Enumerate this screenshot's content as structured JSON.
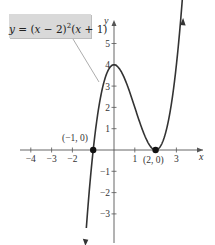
{
  "chart_data": {
    "type": "line",
    "title": "",
    "equation_label": "y = (x − 2)²(x + 1)",
    "function": "y = (x - 2)^2 (x + 1)",
    "xlabel": "x",
    "ylabel": "y",
    "xlim": [
      -4.5,
      3.8
    ],
    "ylim": [
      -4.5,
      5.8
    ],
    "x_ticks": [
      -4,
      -3,
      -2,
      -1,
      1,
      2,
      3
    ],
    "y_ticks": [
      -3,
      -2,
      -1,
      1,
      2,
      3,
      4,
      5
    ],
    "x_tick_labels": [
      "−4",
      "−3",
      "−2",
      "",
      "1",
      "",
      "3"
    ],
    "y_tick_labels": [
      "−3",
      "−2",
      "−1",
      "1",
      "2",
      "3",
      "4",
      "5"
    ],
    "grid": false,
    "series": [
      {
        "name": "y = (x − 2)²(x + 1)",
        "x": [
          -1.3,
          -1,
          -0.5,
          0,
          0.5,
          1,
          1.5,
          2,
          2.5,
          3,
          3.4
        ],
        "y": [
          -3.87,
          0,
          3.125,
          4,
          3.375,
          2,
          0.625,
          0,
          0.875,
          4,
          8.23
        ]
      }
    ],
    "points": [
      {
        "label": "(−1, 0)",
        "x": -1,
        "y": 0
      },
      {
        "label": "(2, 0)",
        "x": 2,
        "y": 0
      }
    ],
    "annotations": [
      "(−1, 0)",
      "(2, 0)",
      "local max at (0, 4)"
    ]
  },
  "equation": {
    "prefix": "y",
    "eq": " = (",
    "x1": "x",
    "mid": " − 2)",
    "exp": "2",
    "paren": "(",
    "x2": "x",
    "tail": " + 1)"
  }
}
